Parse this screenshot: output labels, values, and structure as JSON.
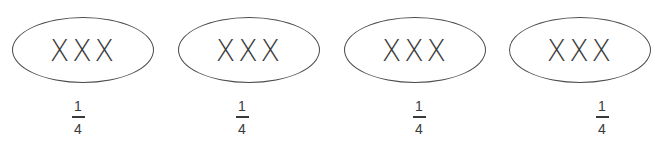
{
  "diagram": {
    "groups": [
      {
        "content": "XXX",
        "fraction": {
          "numerator": "1",
          "denominator": "4"
        }
      },
      {
        "content": "XXX",
        "fraction": {
          "numerator": "1",
          "denominator": "4"
        }
      },
      {
        "content": "XXX",
        "fraction": {
          "numerator": "1",
          "denominator": "4"
        }
      },
      {
        "content": "XXX",
        "fraction": {
          "numerator": "1",
          "denominator": "4"
        }
      }
    ],
    "colors": {
      "stroke": "#4a4a4a",
      "text": "#3a3a3a",
      "background": "#ffffff"
    }
  }
}
